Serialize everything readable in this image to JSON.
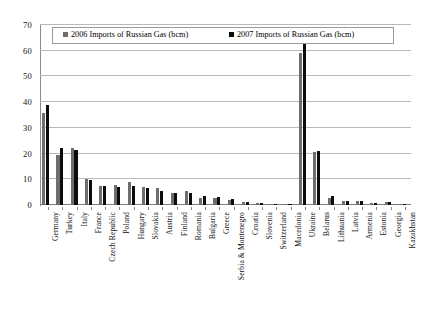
{
  "chart_data": {
    "type": "bar",
    "title": "",
    "xlabel": "",
    "ylabel": "",
    "ylim": [
      0,
      70
    ],
    "yticks": [
      0,
      10,
      20,
      30,
      40,
      50,
      60,
      70
    ],
    "grid": true,
    "legend_position": "top",
    "categories": [
      "Germany",
      "Turkey",
      "Italy",
      "France",
      "Czech Republic",
      "Poland",
      "Hungary",
      "Slovakia",
      "Austria",
      "Finland",
      "Romania",
      "Bulgaria",
      "Greece",
      "Serbia & Montenegro",
      "Croatia",
      "Slovenia",
      "Switzerland",
      "Macedonia",
      "Ukraine",
      "Belarus",
      "Lithuania",
      "Latvia",
      "Armenia",
      "Estonia",
      "Georgia",
      "Kazakhstan"
    ],
    "series": [
      {
        "name": "2006 Imports of Russian Gas (bcm)",
        "color": "#6e6e6e",
        "values": [
          35.6,
          19.3,
          22.1,
          10.0,
          7.4,
          7.7,
          8.8,
          7.0,
          6.6,
          4.5,
          5.5,
          2.7,
          2.7,
          2.1,
          1.1,
          0.6,
          0.4,
          0.1,
          59.0,
          20.5,
          2.8,
          1.4,
          1.7,
          0.8,
          1.1,
          0.3
        ]
      },
      {
        "name": "2007 Imports of Russian Gas (bcm)",
        "color": "#0c0c0c",
        "values": [
          38.9,
          22.0,
          21.5,
          9.6,
          7.4,
          7.2,
          7.5,
          6.6,
          5.4,
          4.7,
          4.5,
          3.5,
          3.1,
          2.2,
          1.1,
          0.6,
          0.4,
          0.1,
          62.5,
          21.1,
          3.4,
          1.5,
          1.7,
          0.9,
          1.1,
          0.3
        ]
      }
    ]
  },
  "legend": {
    "items": [
      "2006 Imports of Russian Gas (bcm)",
      "2007 Imports of Russian Gas (bcm)"
    ]
  }
}
